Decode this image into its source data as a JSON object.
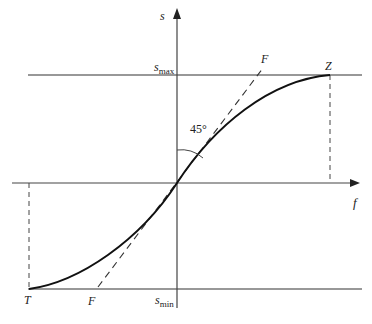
{
  "diagram": {
    "axes": {
      "vertical_label": "s",
      "horizontal_label": "f"
    },
    "levels": {
      "max_label_main": "s",
      "max_label_sub": "max",
      "min_label_main": "s",
      "min_label_sub": "min"
    },
    "points": {
      "upper_end": "Z",
      "lower_end": "T"
    },
    "lines": {
      "diagonal_upper_label": "F",
      "diagonal_lower_label": "F"
    },
    "angle_label": "45°",
    "colors": {
      "stroke": "#222222",
      "axis": "#444444",
      "background": "#ffffff"
    }
  }
}
